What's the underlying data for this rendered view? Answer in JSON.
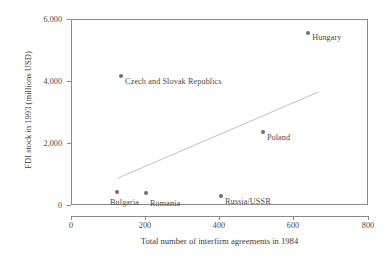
{
  "chart_data": {
    "type": "scatter",
    "title": "",
    "xlabel": "Total number of interfirm agreements in 1984",
    "ylabel": "FDI stock in 1993 (millions USD)",
    "xlim": [
      0,
      800
    ],
    "ylim": [
      0,
      6000
    ],
    "grid": false,
    "legend": "none",
    "xticks": [
      "0",
      "200",
      "400",
      "600",
      "800"
    ],
    "xtick_values": [
      0,
      200,
      400,
      600,
      800
    ],
    "yticks": [
      "0",
      "2,000",
      "4,000",
      "6,000"
    ],
    "ytick_values": [
      0,
      2000,
      4000,
      6000
    ],
    "points": [
      {
        "label": "Hungary",
        "x": 639,
        "y": 5548
      },
      {
        "label": "Czech and Slovak Republics",
        "x": 135,
        "y": 4161
      },
      {
        "label": "Poland",
        "x": 517,
        "y": 2355
      },
      {
        "label": "Russia/USSR",
        "x": 404,
        "y": 290
      },
      {
        "label": "Bulgaria",
        "x": 124,
        "y": 419
      },
      {
        "label": "Romania",
        "x": 202,
        "y": 387
      }
    ],
    "trendline": {
      "name": "fitted regression line",
      "x_start": 127,
      "y_start": 871,
      "x_end": 666,
      "y_end": 3645
    },
    "colors": {
      "marker": "#6e6e6e",
      "trendline": "#c9c9c9",
      "axis": "#8a8a8a",
      "text": "#3b3b3b"
    }
  }
}
